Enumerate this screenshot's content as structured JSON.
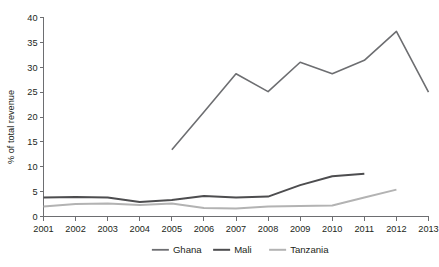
{
  "chart_data": {
    "type": "line",
    "title": "",
    "xlabel": "",
    "ylabel": "% of total revenue",
    "xlim": [
      2001,
      2013
    ],
    "ylim": [
      0,
      40
    ],
    "ytick_values": [
      0,
      5,
      10,
      15,
      20,
      25,
      30,
      35,
      40
    ],
    "ytick_labels": [
      "0",
      "5",
      "10",
      "15",
      "20",
      "25",
      "30",
      "35",
      "40"
    ],
    "xtick_labels": [
      "2001",
      "2002",
      "2003",
      "2004",
      "2005",
      "2006",
      "2007",
      "2008",
      "2009",
      "2010",
      "2011",
      "2012",
      "2013"
    ],
    "grid": false,
    "legend_position": "bottom",
    "series": [
      {
        "name": "Ghana",
        "color": "#6d6e71",
        "stroke_width": 1.6,
        "x": [
          2005,
          2006,
          2007,
          2008,
          2009,
          2010,
          2011,
          2012,
          2013
        ],
        "values": [
          13.4,
          21.0,
          28.7,
          25.1,
          31.0,
          28.7,
          31.4,
          37.2,
          25.0
        ]
      },
      {
        "name": "Mali",
        "color": "#4d4d4f",
        "stroke_width": 2.0,
        "x": [
          2001,
          2002,
          2003,
          2004,
          2005,
          2006,
          2007,
          2008,
          2009,
          2010,
          2011
        ],
        "values": [
          3.8,
          3.9,
          3.8,
          2.9,
          3.3,
          4.1,
          3.8,
          4.0,
          6.3,
          8.1,
          8.6
        ]
      },
      {
        "name": "Tanzania",
        "color": "#b3b3b3",
        "stroke_width": 2.0,
        "x": [
          2001,
          2002,
          2003,
          2004,
          2005,
          2006,
          2007,
          2008,
          2009,
          2010,
          2011,
          2012
        ],
        "values": [
          2.0,
          2.5,
          2.6,
          2.3,
          2.6,
          1.7,
          1.6,
          2.0,
          2.1,
          2.2,
          3.8,
          5.4
        ]
      }
    ]
  },
  "legend": {
    "items": [
      {
        "label": "Ghana",
        "color": "#6d6e71"
      },
      {
        "label": "Mali",
        "color": "#4d4d4f"
      },
      {
        "label": "Tanzania",
        "color": "#b3b3b3"
      }
    ]
  },
  "axes": {
    "y_title": "% of total revenue"
  }
}
